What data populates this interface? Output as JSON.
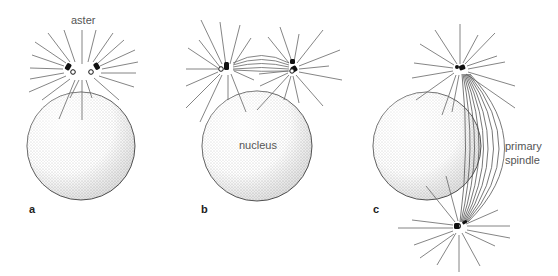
{
  "figure": {
    "panels": [
      {
        "id": "a",
        "label": "a",
        "annotation": "aster"
      },
      {
        "id": "b",
        "label": "b",
        "annotation": "nucleus"
      },
      {
        "id": "c",
        "label": "c",
        "annotation": "primary\nspindle"
      }
    ]
  },
  "labels": {
    "aster": "aster",
    "nucleus": "nucleus",
    "primary": "primary",
    "spindle": "spindle",
    "panel_a": "a",
    "panel_b": "b",
    "panel_c": "c"
  },
  "colors": {
    "line": "#555555",
    "outline": "#444444",
    "stipple": "#777777",
    "centriole": "#111111"
  }
}
